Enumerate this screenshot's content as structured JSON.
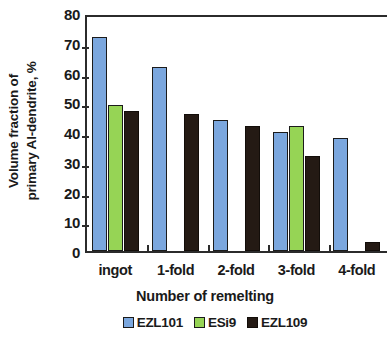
{
  "chart_data": {
    "type": "bar",
    "title": "",
    "xlabel": "Number of remelting",
    "ylabel": "Volume fraction of primary Al-dendrite, %",
    "ylabel_line1": "Volume fraction of",
    "ylabel_line2": "primary Al-dendrite, %",
    "categories": [
      "ingot",
      "1-fold",
      "2-fold",
      "3-fold",
      "4-fold"
    ],
    "series": [
      {
        "name": "EZL101",
        "color": "#7BA7DE",
        "values": [
          72,
          62,
          44,
          40,
          38
        ]
      },
      {
        "name": "ESi9",
        "color": "#96D455",
        "values": [
          49,
          null,
          null,
          42,
          null
        ]
      },
      {
        "name": "EZL109",
        "color": "#241A14",
        "values": [
          47,
          46,
          42,
          32,
          3
        ]
      }
    ],
    "ylim": [
      0,
      80
    ],
    "ytick_values": [
      80,
      70,
      60,
      50,
      40,
      30,
      20,
      10,
      0
    ],
    "ytick_labels": [
      "80",
      "70",
      "60",
      "50",
      "40",
      "30",
      "20",
      "10",
      "0"
    ],
    "grid": false,
    "legend_position": "bottom"
  },
  "legend": {
    "items": [
      {
        "label": "EZL101",
        "swatch": "blue-square-swatch"
      },
      {
        "label": "ESi9",
        "swatch": "green-square-swatch"
      },
      {
        "label": "EZL109",
        "swatch": "black-square-swatch"
      }
    ]
  }
}
